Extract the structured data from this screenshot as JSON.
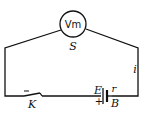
{
  "diagram": {
    "meter": {
      "label": "Vm",
      "name_label": "S"
    },
    "switch": {
      "label": "K"
    },
    "battery": {
      "emf_label": "E",
      "resistance_label": "r",
      "name_label": "B",
      "polarity_plus": "+"
    },
    "current": {
      "label": "i"
    }
  }
}
